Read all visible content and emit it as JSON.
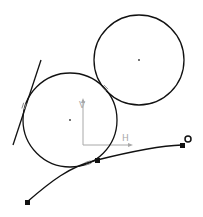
{
  "canvas": {
    "width": 203,
    "height": 217,
    "background": "#ffffff"
  },
  "colors": {
    "geometry": "#111111",
    "axis": "#a8a8a8",
    "constraint": "#8a8a8a"
  },
  "axis": {
    "origin": [
      83,
      145
    ],
    "h_label": "H",
    "v_label": "V",
    "h_end": [
      128,
      145
    ],
    "v_end": [
      83,
      100
    ]
  },
  "circles": [
    {
      "id": "circle-upper-right",
      "cx": 139,
      "cy": 60,
      "r": 45
    },
    {
      "id": "circle-lower-left",
      "cx": 70,
      "cy": 120,
      "r": 47
    }
  ],
  "line": {
    "id": "tangent-line",
    "x1": 13,
    "y1": 145,
    "x2": 41,
    "y2": 60
  },
  "spline": {
    "id": "spline-curve",
    "points": [
      [
        27,
        202
      ],
      [
        97,
        160
      ],
      [
        182,
        145
      ]
    ],
    "end_marker": [
      188,
      139
    ]
  },
  "tangency_markers": [
    {
      "id": "tangent-line-circle",
      "x": 24,
      "y": 106
    },
    {
      "id": "circle-circle",
      "x": 105,
      "y": 88
    },
    {
      "id": "spline-circle",
      "x": 88,
      "y": 163
    }
  ]
}
